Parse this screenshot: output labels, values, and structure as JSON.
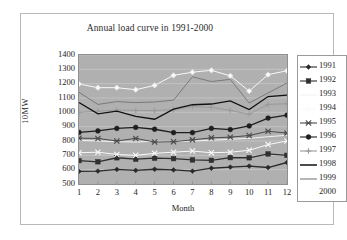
{
  "chart_data": {
    "type": "line",
    "title": "Annual load curve in 1991-2000",
    "xlabel": "Month",
    "ylabel": "10MW",
    "categories": [
      "1",
      "2",
      "3",
      "4",
      "5",
      "6",
      "7",
      "8",
      "9",
      "10",
      "11",
      "12"
    ],
    "x": [
      1,
      2,
      3,
      4,
      5,
      6,
      7,
      8,
      9,
      10,
      11,
      12
    ],
    "ylim": [
      500,
      1400
    ],
    "xlim": [
      1,
      12
    ],
    "yticks": [
      500,
      600,
      700,
      800,
      900,
      1000,
      1100,
      1200,
      1300,
      1400
    ],
    "grid": true,
    "legend_position": "right",
    "plot_background": "#b0b0b0",
    "series": [
      {
        "name": "1991",
        "marker": "diamond",
        "color": "#2a2a2a",
        "values": [
          588,
          590,
          602,
          595,
          603,
          598,
          590,
          610,
          618,
          625,
          615,
          650
        ]
      },
      {
        "name": "1992",
        "marker": "square",
        "color": "#303030",
        "values": [
          663,
          655,
          683,
          673,
          680,
          677,
          668,
          665,
          684,
          683,
          710,
          700
        ]
      },
      {
        "name": "1993",
        "marker": "none",
        "color": "#f2f2f2",
        "values": [
          805,
          800,
          795,
          793,
          797,
          795,
          800,
          805,
          812,
          818,
          830,
          840
        ]
      },
      {
        "name": "1994",
        "marker": "cross",
        "color": "#fafafa",
        "values": [
          718,
          722,
          706,
          700,
          714,
          722,
          730,
          718,
          722,
          735,
          775,
          800
        ]
      },
      {
        "name": "1995",
        "marker": "asterisk",
        "color": "#4a4a4a",
        "values": [
          820,
          818,
          800,
          818,
          793,
          795,
          808,
          822,
          827,
          838,
          868,
          855
        ]
      },
      {
        "name": "1996",
        "marker": "circle",
        "color": "#1e1e1e",
        "values": [
          860,
          870,
          888,
          895,
          882,
          858,
          858,
          888,
          880,
          905,
          960,
          980
        ]
      },
      {
        "name": "1997",
        "marker": "plus",
        "color": "#9a9a9a",
        "values": [
          1000,
          1008,
          1015,
          1013,
          1012,
          1018,
          1040,
          1035,
          1013,
          988,
          1055,
          1060
        ]
      },
      {
        "name": "1998",
        "marker": "none",
        "color": "#111111",
        "values": [
          1068,
          990,
          1008,
          972,
          952,
          1022,
          1053,
          1058,
          1080,
          1020,
          1110,
          1120
        ]
      },
      {
        "name": "1999",
        "marker": "none",
        "color": "#7a7a7a",
        "values": [
          1140,
          1055,
          1075,
          1068,
          1072,
          1085,
          1248,
          1215,
          1230,
          1065,
          1135,
          1205
        ]
      },
      {
        "name": "2000",
        "marker": "diamond-open",
        "color": "#f8f8f8",
        "values": [
          1198,
          1172,
          1172,
          1158,
          1188,
          1258,
          1280,
          1293,
          1255,
          1148,
          1263,
          1290
        ]
      }
    ]
  }
}
